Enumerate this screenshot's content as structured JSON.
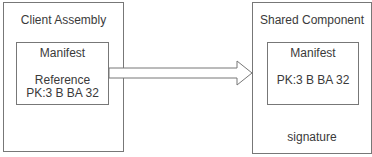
{
  "client": {
    "title": "Client Assembly",
    "manifest": {
      "title": "Manifest",
      "reference_label": "Reference",
      "public_key": "PK:3 B BA 32"
    }
  },
  "shared": {
    "title": "Shared Component",
    "manifest": {
      "title": "Manifest",
      "public_key": "PK:3 B BA 32"
    },
    "footer": "signature"
  },
  "colors": {
    "stroke": "#777777",
    "text": "#3a3a3a"
  }
}
